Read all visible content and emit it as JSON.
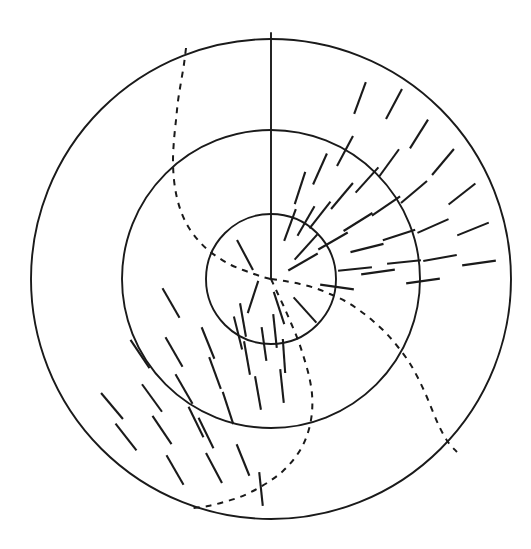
{
  "figure": {
    "background_color": "#ffffff",
    "stroke_color": "#1a1a1a",
    "canvas": {
      "width": 531,
      "height": 549
    }
  },
  "geometry": {
    "center": {
      "x": 271,
      "y": 279
    },
    "circles": [
      {
        "name": "inner-circle",
        "radius": 65,
        "style": "solid",
        "stroke_width": 1.9
      },
      {
        "name": "middle-circle",
        "radius": 149,
        "style": "solid",
        "stroke_width": 1.9
      },
      {
        "name": "outer-circle",
        "radius": 240,
        "style": "solid",
        "stroke_width": 1.9
      }
    ],
    "radius_line": {
      "name": "vertical-radius-line",
      "from_radius": 0,
      "to_radius": 246,
      "angle_deg": 90,
      "style": "solid",
      "stroke_width": 1.9
    }
  },
  "dashed_spirals": [
    {
      "name": "spiral-upper-left",
      "style": "dashed",
      "dash_pattern": "6 6",
      "stroke_width": 2.0,
      "points": [
        [
          186,
          48
        ],
        [
          184,
          64
        ],
        [
          181,
          82
        ],
        [
          178,
          101
        ],
        [
          176,
          120
        ],
        [
          174,
          140
        ],
        [
          173,
          160
        ],
        [
          174,
          180
        ],
        [
          177,
          198
        ],
        [
          182,
          214
        ],
        [
          189,
          228
        ],
        [
          198,
          240
        ],
        [
          208,
          250
        ],
        [
          219,
          258
        ],
        [
          231,
          265
        ],
        [
          243,
          270
        ],
        [
          254,
          274
        ],
        [
          263,
          277
        ],
        [
          271,
          279
        ]
      ]
    },
    {
      "name": "spiral-lower-right",
      "style": "dashed",
      "dash_pattern": "6 6",
      "stroke_width": 2.0,
      "points": [
        [
          271,
          279
        ],
        [
          285,
          281
        ],
        [
          300,
          284
        ],
        [
          315,
          288
        ],
        [
          330,
          294
        ],
        [
          345,
          301
        ],
        [
          359,
          310
        ],
        [
          373,
          321
        ],
        [
          386,
          333
        ],
        [
          398,
          347
        ],
        [
          409,
          362
        ],
        [
          418,
          378
        ],
        [
          426,
          395
        ],
        [
          433,
          412
        ],
        [
          440,
          428
        ],
        [
          448,
          442
        ],
        [
          457,
          452
        ]
      ]
    },
    {
      "name": "spiral-lower-left",
      "style": "dashed",
      "dash_pattern": "6 6",
      "stroke_width": 2.0,
      "points": [
        [
          271,
          279
        ],
        [
          277,
          292
        ],
        [
          284,
          307
        ],
        [
          291,
          323
        ],
        [
          298,
          340
        ],
        [
          304,
          358
        ],
        [
          309,
          376
        ],
        [
          312,
          394
        ],
        [
          312,
          412
        ],
        [
          309,
          429
        ],
        [
          303,
          445
        ],
        [
          294,
          459
        ],
        [
          283,
          471
        ],
        [
          270,
          481
        ],
        [
          255,
          490
        ],
        [
          240,
          497
        ],
        [
          224,
          502
        ],
        [
          208,
          506
        ],
        [
          193,
          508
        ]
      ]
    }
  ],
  "tick_field": {
    "name": "orientation-tick-marks",
    "description": "Short straight line segments indicating local orientation across angular/radial bands",
    "stroke_width": 2.1,
    "tick_length": 34,
    "count": 60,
    "ticks": [
      {
        "cx": 394,
        "cy": 104,
        "angle_deg": 62
      },
      {
        "cx": 419,
        "cy": 134,
        "angle_deg": 58
      },
      {
        "cx": 443,
        "cy": 162,
        "angle_deg": 50
      },
      {
        "cx": 462,
        "cy": 194,
        "angle_deg": 38
      },
      {
        "cx": 473,
        "cy": 229,
        "angle_deg": 22
      },
      {
        "cx": 479,
        "cy": 263,
        "angle_deg": 8
      },
      {
        "cx": 360,
        "cy": 98,
        "angle_deg": 70
      },
      {
        "cx": 389,
        "cy": 163,
        "angle_deg": 54
      },
      {
        "cx": 414,
        "cy": 192,
        "angle_deg": 40
      },
      {
        "cx": 433,
        "cy": 226,
        "angle_deg": 24
      },
      {
        "cx": 440,
        "cy": 258,
        "angle_deg": 10
      },
      {
        "cx": 345,
        "cy": 151,
        "angle_deg": 62
      },
      {
        "cx": 367,
        "cy": 180,
        "angle_deg": 48
      },
      {
        "cx": 386,
        "cy": 206,
        "angle_deg": 34
      },
      {
        "cx": 399,
        "cy": 235,
        "angle_deg": 18
      },
      {
        "cx": 404,
        "cy": 262,
        "angle_deg": 6
      },
      {
        "cx": 320,
        "cy": 169,
        "angle_deg": 66
      },
      {
        "cx": 342,
        "cy": 196,
        "angle_deg": 50
      },
      {
        "cx": 358,
        "cy": 222,
        "angle_deg": 32
      },
      {
        "cx": 367,
        "cy": 248,
        "angle_deg": 14
      },
      {
        "cx": 300,
        "cy": 188,
        "angle_deg": 72
      },
      {
        "cx": 320,
        "cy": 215,
        "angle_deg": 52
      },
      {
        "cx": 333,
        "cy": 241,
        "angle_deg": 30
      },
      {
        "cx": 290,
        "cy": 225,
        "angle_deg": 70
      },
      {
        "cx": 306,
        "cy": 247,
        "angle_deg": 48
      },
      {
        "cx": 303,
        "cy": 262,
        "angle_deg": 30
      },
      {
        "cx": 245,
        "cy": 255,
        "angle_deg": 118
      },
      {
        "cx": 253,
        "cy": 297,
        "angle_deg": 72
      },
      {
        "cx": 279,
        "cy": 308,
        "angle_deg": 108
      },
      {
        "cx": 305,
        "cy": 310,
        "angle_deg": 132
      },
      {
        "cx": 306,
        "cy": 221,
        "angle_deg": 60
      },
      {
        "cx": 171,
        "cy": 303,
        "angle_deg": 120
      },
      {
        "cx": 140,
        "cy": 354,
        "angle_deg": 124
      },
      {
        "cx": 174,
        "cy": 352,
        "angle_deg": 120
      },
      {
        "cx": 208,
        "cy": 343,
        "angle_deg": 112
      },
      {
        "cx": 238,
        "cy": 333,
        "angle_deg": 104
      },
      {
        "cx": 247,
        "cy": 358,
        "angle_deg": 100
      },
      {
        "cx": 215,
        "cy": 373,
        "angle_deg": 110
      },
      {
        "cx": 184,
        "cy": 389,
        "angle_deg": 120
      },
      {
        "cx": 152,
        "cy": 398,
        "angle_deg": 126
      },
      {
        "cx": 112,
        "cy": 406,
        "angle_deg": 130
      },
      {
        "cx": 126,
        "cy": 437,
        "angle_deg": 128
      },
      {
        "cx": 162,
        "cy": 430,
        "angle_deg": 124
      },
      {
        "cx": 196,
        "cy": 422,
        "angle_deg": 116
      },
      {
        "cx": 228,
        "cy": 408,
        "angle_deg": 108
      },
      {
        "cx": 258,
        "cy": 393,
        "angle_deg": 100
      },
      {
        "cx": 282,
        "cy": 386,
        "angle_deg": 96
      },
      {
        "cx": 284,
        "cy": 356,
        "angle_deg": 94
      },
      {
        "cx": 264,
        "cy": 344,
        "angle_deg": 98
      },
      {
        "cx": 243,
        "cy": 320,
        "angle_deg": 100
      },
      {
        "cx": 275,
        "cy": 331,
        "angle_deg": 96
      },
      {
        "cx": 175,
        "cy": 470,
        "angle_deg": 120
      },
      {
        "cx": 214,
        "cy": 468,
        "angle_deg": 118
      },
      {
        "cx": 243,
        "cy": 460,
        "angle_deg": 112
      },
      {
        "cx": 261,
        "cy": 489,
        "angle_deg": 96
      },
      {
        "cx": 206,
        "cy": 433,
        "angle_deg": 116
      },
      {
        "cx": 355,
        "cy": 269,
        "angle_deg": 6
      },
      {
        "cx": 378,
        "cy": 272,
        "angle_deg": 8
      },
      {
        "cx": 423,
        "cy": 281,
        "angle_deg": 8
      },
      {
        "cx": 337,
        "cy": 287,
        "angle_deg": 172
      }
    ]
  }
}
